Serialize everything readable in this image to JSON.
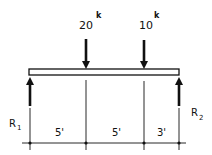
{
  "diagram": {
    "type": "simply-supported-beam",
    "colors": {
      "ink": "#111111",
      "background": "#ffffff"
    },
    "loads": [
      {
        "value": "20",
        "unit": "k",
        "position_ft": 5
      },
      {
        "value": "10",
        "unit": "k",
        "position_ft": 10
      }
    ],
    "reactions": [
      {
        "label": "R",
        "subscript": "1"
      },
      {
        "label": "R",
        "subscript": "2"
      }
    ],
    "dimensions": [
      {
        "label": "5'"
      },
      {
        "label": "5'"
      },
      {
        "label": "3'"
      }
    ],
    "span_ft": 13
  }
}
